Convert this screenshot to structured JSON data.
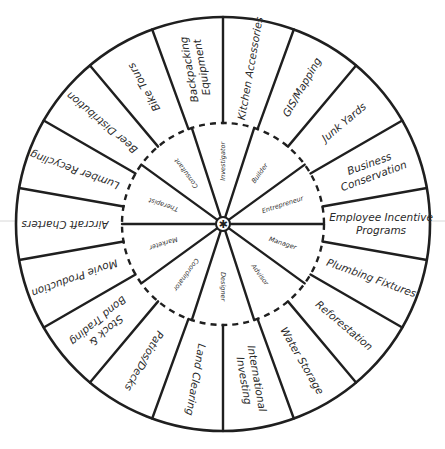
{
  "wheel": {
    "center": [
      223,
      224
    ],
    "outer_radius": 207,
    "inner_radius": 101,
    "hub_radius": 7,
    "hub_icon": "asterisk-icon",
    "line_color": "#1f1f1f",
    "outer_ring": {
      "start_angle_deg": 0,
      "segment_deg": 20,
      "segments": [
        {
          "label": [
            "Kitchen Accessories"
          ]
        },
        {
          "label": [
            "GIS/Mapping"
          ]
        },
        {
          "label": [
            "Junk Yards"
          ]
        },
        {
          "label": [
            "Business",
            "Conservation"
          ]
        },
        {
          "label": [
            "Employee Incentive",
            "Programs"
          ]
        },
        {
          "label": [
            "Plumbing Fixtures"
          ]
        },
        {
          "label": [
            "Reforestation"
          ]
        },
        {
          "label": [
            "Water Storage"
          ]
        },
        {
          "label": [
            "International",
            "Investing"
          ]
        },
        {
          "label": [
            "Land Clearing"
          ]
        },
        {
          "label": [
            "Patios/Decks"
          ]
        },
        {
          "label": [
            "Stock &",
            "Bond Trading"
          ]
        },
        {
          "label": [
            "Movie Production"
          ]
        },
        {
          "label": [
            "Aircraft Charters"
          ]
        },
        {
          "label": [
            "Lumber Recycling"
          ]
        },
        {
          "label": [
            "Beer Distribution"
          ]
        },
        {
          "label": [
            "Bike Tours"
          ]
        },
        {
          "label": [
            "Backpacking",
            "Equipment"
          ]
        }
      ]
    },
    "inner_ring": {
      "start_angle_deg": -18,
      "segment_deg": 36,
      "segments": [
        {
          "label": "Investigator"
        },
        {
          "label": "Builder"
        },
        {
          "label": "Entrepreneur"
        },
        {
          "label": "Manager"
        },
        {
          "label": "Advisor"
        },
        {
          "label": "Designer"
        },
        {
          "label": "Coordinator"
        },
        {
          "label": "Marketer"
        },
        {
          "label": "Therapist"
        },
        {
          "label": "Consultant"
        }
      ]
    }
  }
}
